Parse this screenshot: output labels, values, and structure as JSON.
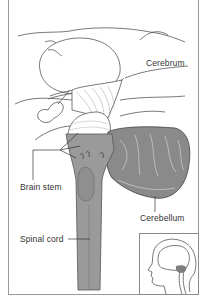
{
  "figure": {
    "labels": {
      "cerebrum": "Cerebrum",
      "brain_stem": "Brain stem",
      "cerebellum": "Cerebellum",
      "spinal_cord": "Spinal cord"
    },
    "colors": {
      "line": "#555555",
      "stem_fill": "#9a9a9a",
      "stem_dark": "#7d7d7d",
      "cerebellum_fill": "#8a8a8a",
      "frame": "#9a9a9a"
    },
    "inset": {
      "description": "head-silhouette-with-brain-location"
    }
  }
}
